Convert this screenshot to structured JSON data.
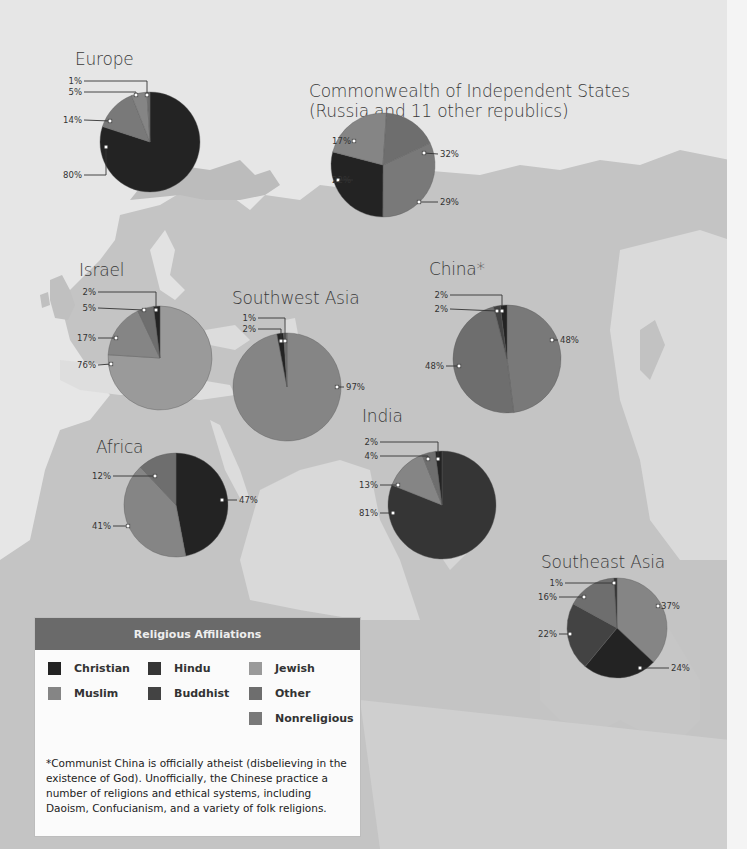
{
  "colors": {
    "christian": "#232323",
    "muslim": "#858585",
    "hindu": "#353535",
    "buddhist": "#434343",
    "jewish": "#9a9a9a",
    "other": "#6e6e6e",
    "nonreligious": "#797979",
    "legend_header": "#6a6a6a",
    "land": "#bdbdbd",
    "sea": "#e4e4e4"
  },
  "legend": {
    "title": "Religious Affiliations",
    "items": [
      {
        "key": "christian",
        "label": "Christian"
      },
      {
        "key": "muslim",
        "label": "Muslim"
      },
      {
        "key": "hindu",
        "label": "Hindu"
      },
      {
        "key": "buddhist",
        "label": "Buddhist"
      },
      {
        "key": "jewish",
        "label": "Jewish"
      },
      {
        "key": "other",
        "label": "Other"
      },
      {
        "key": "nonreligious",
        "label": "Nonreligious"
      }
    ],
    "note": "*Communist China is officially atheist (disbelieving in the existence of God). Unofficially, the Chinese practice a number of religions and ethical systems, including Daoism, Confucianism, and a variety of folk religions."
  },
  "regions": {
    "europe": {
      "title": "Europe"
    },
    "cis": {
      "title_line1": "Commonwealth of Independent States",
      "title_line2": "(Russia and 11 other republics)"
    },
    "israel": {
      "title": "Israel"
    },
    "southwest_asia": {
      "title": "Southwest Asia"
    },
    "china": {
      "title": "China*"
    },
    "africa": {
      "title": "Africa"
    },
    "india": {
      "title": "India"
    },
    "southeast_asia": {
      "title": "Southeast Asia"
    }
  },
  "chart_data": [
    {
      "type": "pie",
      "title": "Europe",
      "slices": [
        {
          "label": "Christian",
          "key": "christian",
          "value": 80
        },
        {
          "label": "Nonreligious",
          "key": "nonreligious",
          "value": 14
        },
        {
          "label": "Muslim",
          "key": "muslim",
          "value": 5
        },
        {
          "label": "Other",
          "key": "other",
          "value": 1
        }
      ]
    },
    {
      "type": "pie",
      "title": "Commonwealth of Independent States (Russia and 11 other republics)",
      "slices": [
        {
          "label": "Nonreligious",
          "key": "nonreligious",
          "value": 32
        },
        {
          "label": "Christian",
          "key": "christian",
          "value": 29
        },
        {
          "label": "Muslim",
          "key": "muslim",
          "value": 22
        },
        {
          "label": "Other",
          "key": "other",
          "value": 17
        }
      ]
    },
    {
      "type": "pie",
      "title": "Israel",
      "slices": [
        {
          "label": "Jewish",
          "key": "jewish",
          "value": 76
        },
        {
          "label": "Muslim",
          "key": "muslim",
          "value": 17
        },
        {
          "label": "Other",
          "key": "other",
          "value": 5
        },
        {
          "label": "Christian",
          "key": "christian",
          "value": 2
        }
      ]
    },
    {
      "type": "pie",
      "title": "Southwest Asia",
      "slices": [
        {
          "label": "Muslim",
          "key": "muslim",
          "value": 97
        },
        {
          "label": "Christian",
          "key": "christian",
          "value": 2
        },
        {
          "label": "Other",
          "key": "other",
          "value": 1
        }
      ]
    },
    {
      "type": "pie",
      "title": "China*",
      "slices": [
        {
          "label": "Nonreligious",
          "key": "nonreligious",
          "value": 48
        },
        {
          "label": "Other",
          "key": "other",
          "value": 48
        },
        {
          "label": "Buddhist",
          "key": "buddhist",
          "value": 2
        },
        {
          "label": "Christian",
          "key": "christian",
          "value": 2
        }
      ]
    },
    {
      "type": "pie",
      "title": "Africa",
      "slices": [
        {
          "label": "Christian",
          "key": "christian",
          "value": 47
        },
        {
          "label": "Muslim",
          "key": "muslim",
          "value": 41
        },
        {
          "label": "Other",
          "key": "other",
          "value": 12
        }
      ]
    },
    {
      "type": "pie",
      "title": "India",
      "slices": [
        {
          "label": "Hindu",
          "key": "hindu",
          "value": 81
        },
        {
          "label": "Muslim",
          "key": "muslim",
          "value": 13
        },
        {
          "label": "Other",
          "key": "other",
          "value": 4
        },
        {
          "label": "Christian",
          "key": "christian",
          "value": 2
        }
      ]
    },
    {
      "type": "pie",
      "title": "Southeast Asia",
      "slices": [
        {
          "label": "Muslim",
          "key": "muslim",
          "value": 37
        },
        {
          "label": "Christian",
          "key": "christian",
          "value": 24
        },
        {
          "label": "Buddhist",
          "key": "buddhist",
          "value": 22
        },
        {
          "label": "Other",
          "key": "other",
          "value": 16
        },
        {
          "label": "Hindu",
          "key": "hindu",
          "value": 1
        }
      ]
    }
  ]
}
